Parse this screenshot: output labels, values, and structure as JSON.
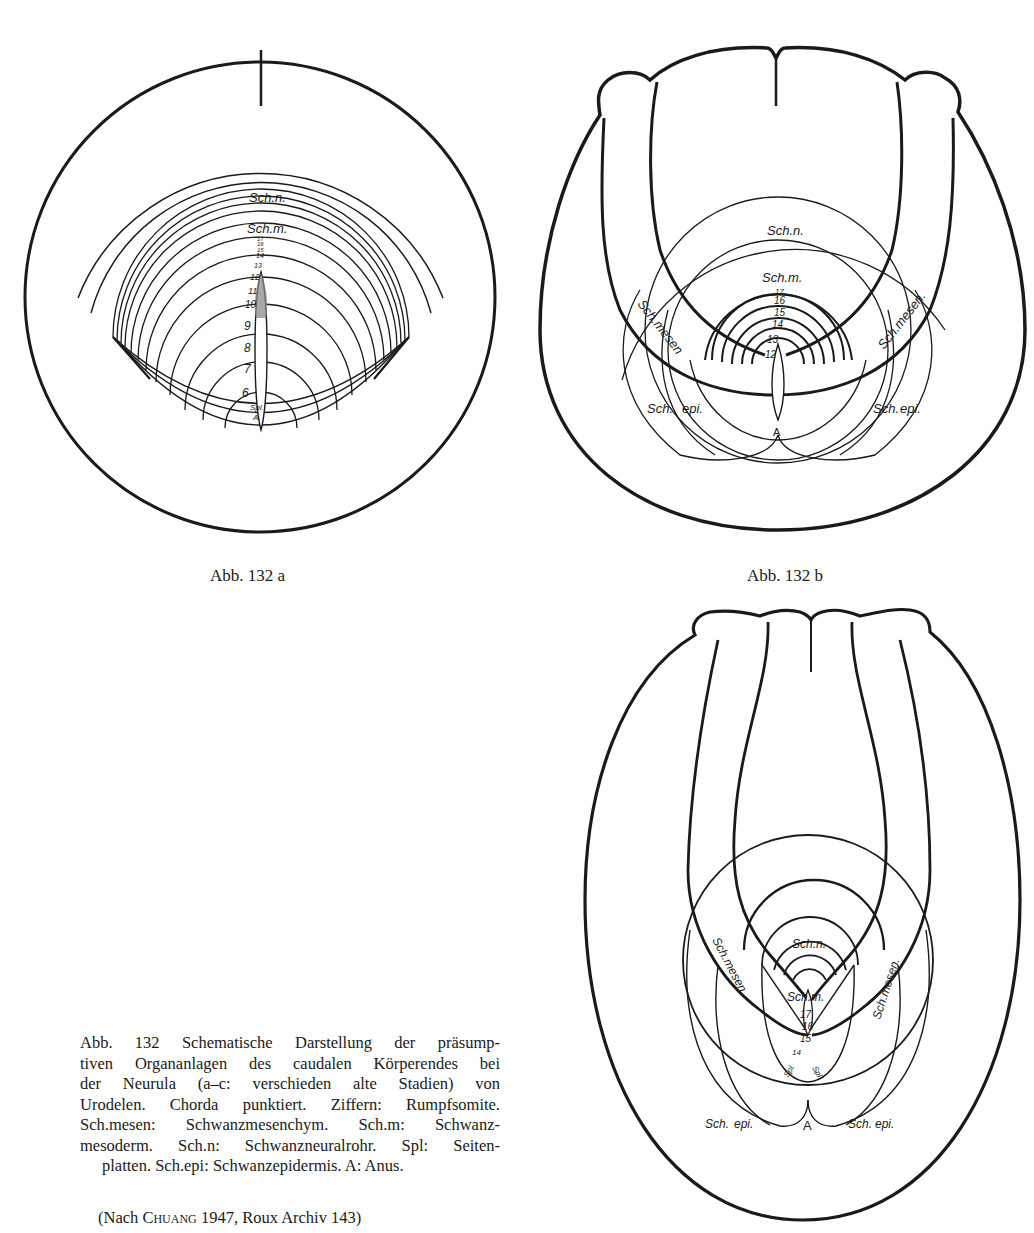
{
  "figures": {
    "a": {
      "label": "Abb. 132 a",
      "region_labels": {
        "sch_n": "Sch.n.",
        "sch_m": "Sch.m.",
        "spl": "Spl.",
        "anus": "A"
      },
      "somite_numbers": [
        "17",
        "16",
        "15",
        "14",
        "13",
        "12",
        "11",
        "10",
        "9",
        "8",
        "7",
        "6"
      ]
    },
    "b": {
      "label": "Abb. 132 b",
      "region_labels": {
        "sch_n": "Sch.n.",
        "sch_m": "Sch.m.",
        "sch_mesen_left": "Sch.mesen",
        "sch_mesen_right": "Sch.mesen.",
        "sch_left": "Sch.",
        "epi_left": "epi.",
        "sch_right": "Sch.",
        "epi_right": "epi.",
        "anus": "A"
      },
      "somite_numbers": [
        "17",
        "16",
        "15",
        "14",
        "13",
        "12"
      ]
    },
    "c": {
      "region_labels": {
        "sch_n": "Sch.n.",
        "sch_m": "Sch.m.",
        "sch_mesen_left": "Sch.mesen",
        "sch_mesen_right": "Sch.mesen.",
        "spl_left": "Spl.",
        "spl_right": "Spl.",
        "sch_left": "Sch.",
        "epi_left": "epi.",
        "sch_right": "Sch.",
        "epi_right": "epi.",
        "anus": "A"
      },
      "somite_numbers": [
        "17",
        "16",
        "15",
        "14"
      ]
    }
  },
  "caption": {
    "lines": [
      "Abb. 132 Schematische Darstellung der präsump-",
      "tiven Organanlagen des caudalen Körperendes bei",
      "der Neurula (a–c: verschieden alte Stadien) von",
      "Urodelen. Chorda punktiert. Ziffern: Rumpfsomite.",
      "Sch.mesen: Schwanzmesenchym. Sch.m: Schwanz-",
      "mesoderm. Sch.n: Schwanzneuralrohr. Spl: Seiten-",
      "platten. Sch.epi: Schwanzepidermis. A: Anus."
    ],
    "source_prefix": "(Nach ",
    "source_author": "Chuang",
    "source_suffix": " 1947, Roux Archiv 143)"
  },
  "colors": {
    "ink": "#1a1a1a",
    "paper": "#ffffff",
    "chorda_stipple": "#8a8a8a"
  }
}
